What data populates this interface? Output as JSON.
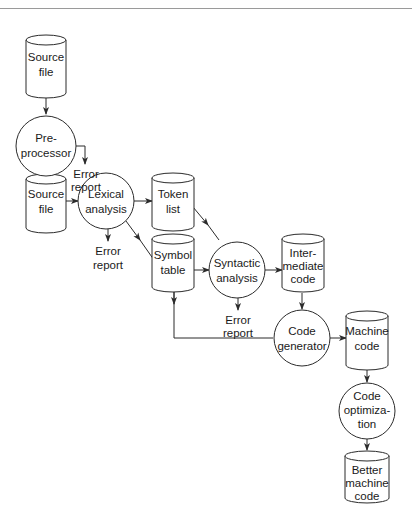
{
  "diagram": {
    "nodes": [
      {
        "id": "source-file-1",
        "shape": "cylinder",
        "lines": [
          "Source",
          "file"
        ]
      },
      {
        "id": "preprocessor",
        "shape": "circle",
        "lines": [
          "Pre-",
          "processor"
        ]
      },
      {
        "id": "error-report-1",
        "shape": "text",
        "lines": [
          "Error",
          "report"
        ]
      },
      {
        "id": "source-file-2",
        "shape": "cylinder",
        "lines": [
          "Source",
          "file"
        ]
      },
      {
        "id": "lexical-analysis",
        "shape": "circle",
        "lines": [
          "Lexical",
          "analysis"
        ]
      },
      {
        "id": "error-report-2",
        "shape": "text",
        "lines": [
          "Error",
          "report"
        ]
      },
      {
        "id": "token-list",
        "shape": "cylinder",
        "lines": [
          "Token",
          "list"
        ]
      },
      {
        "id": "symbol-table",
        "shape": "cylinder",
        "lines": [
          "Symbol",
          "table"
        ]
      },
      {
        "id": "syntactic-analysis",
        "shape": "circle",
        "lines": [
          "Syntactic",
          "analysis"
        ]
      },
      {
        "id": "error-report-3",
        "shape": "text",
        "lines": [
          "Error",
          "report"
        ]
      },
      {
        "id": "intermediate-code",
        "shape": "cylinder",
        "lines": [
          "Inter-",
          "mediate",
          "code"
        ]
      },
      {
        "id": "code-generator",
        "shape": "circle",
        "lines": [
          "Code",
          "generator"
        ]
      },
      {
        "id": "machine-code",
        "shape": "cylinder",
        "lines": [
          "Machine",
          "code"
        ]
      },
      {
        "id": "code-optimization",
        "shape": "circle",
        "lines": [
          "Code",
          "optimiza-",
          "tion"
        ]
      },
      {
        "id": "better-machine-code",
        "shape": "cylinder",
        "lines": [
          "Better",
          "machine",
          "code"
        ]
      }
    ],
    "edges": [
      {
        "from": "source-file-1",
        "to": "preprocessor"
      },
      {
        "from": "preprocessor",
        "to": "error-report-1"
      },
      {
        "from": "preprocessor",
        "to": "source-file-2"
      },
      {
        "from": "source-file-2",
        "to": "lexical-analysis"
      },
      {
        "from": "lexical-analysis",
        "to": "token-list"
      },
      {
        "from": "lexical-analysis",
        "to": "error-report-2"
      },
      {
        "from": "lexical-analysis",
        "to": "symbol-table"
      },
      {
        "from": "token-list",
        "to": "syntactic-analysis"
      },
      {
        "from": "symbol-table",
        "to": "syntactic-analysis"
      },
      {
        "from": "syntactic-analysis",
        "to": "intermediate-code"
      },
      {
        "from": "syntactic-analysis",
        "to": "error-report-3"
      },
      {
        "from": "symbol-table",
        "to": "code-generator"
      },
      {
        "from": "intermediate-code",
        "to": "code-generator"
      },
      {
        "from": "code-generator",
        "to": "machine-code"
      },
      {
        "from": "machine-code",
        "to": "code-optimization"
      },
      {
        "from": "code-optimization",
        "to": "better-machine-code"
      }
    ],
    "colors": {
      "stroke": "#2b2b2b",
      "fill": "#ffffff",
      "text": "#1a1a1a",
      "rule": "#9a9a9a"
    }
  }
}
